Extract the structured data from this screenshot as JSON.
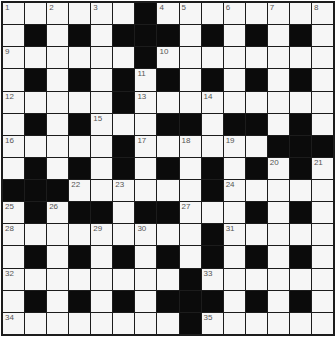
{
  "puzzle": {
    "rows": 15,
    "cols": 15,
    "colors": {
      "white_cell": "#f6f6f6",
      "black_cell": "#0b0b0b",
      "grid_line": "#1c1c1c",
      "number_text": "#555555"
    },
    "grid": [
      "......#........",
      ".#.#.###.#.#.#.",
      "......#........",
      ".#.#.#.#.#.#.#.",
      ".....#.........",
      ".#.#...##.##.#.",
      ".....#......###",
      ".#.#.#.#.#.#.#.",
      "###......#.....",
      ".#.##.##...#.#.",
      ".........#.....",
      ".#.#.#.#.#.#.#.",
      "........#......",
      ".#.#.#.###.#.#.",
      "........#......"
    ],
    "numbers": [
      {
        "n": "1",
        "r": 0,
        "c": 0
      },
      {
        "n": "2",
        "r": 0,
        "c": 2
      },
      {
        "n": "3",
        "r": 0,
        "c": 4
      },
      {
        "n": "4",
        "r": 0,
        "c": 7
      },
      {
        "n": "5",
        "r": 0,
        "c": 8
      },
      {
        "n": "6",
        "r": 0,
        "c": 10
      },
      {
        "n": "7",
        "r": 0,
        "c": 12
      },
      {
        "n": "8",
        "r": 0,
        "c": 14
      },
      {
        "n": "9",
        "r": 2,
        "c": 0
      },
      {
        "n": "10",
        "r": 2,
        "c": 7
      },
      {
        "n": "11",
        "r": 3,
        "c": 6
      },
      {
        "n": "12",
        "r": 4,
        "c": 0
      },
      {
        "n": "13",
        "r": 4,
        "c": 6
      },
      {
        "n": "14",
        "r": 4,
        "c": 9
      },
      {
        "n": "15",
        "r": 5,
        "c": 4
      },
      {
        "n": "16",
        "r": 6,
        "c": 0
      },
      {
        "n": "17",
        "r": 6,
        "c": 6
      },
      {
        "n": "18",
        "r": 6,
        "c": 8
      },
      {
        "n": "19",
        "r": 6,
        "c": 10
      },
      {
        "n": "20",
        "r": 7,
        "c": 12
      },
      {
        "n": "21",
        "r": 7,
        "c": 14
      },
      {
        "n": "22",
        "r": 8,
        "c": 3
      },
      {
        "n": "23",
        "r": 8,
        "c": 5
      },
      {
        "n": "24",
        "r": 8,
        "c": 10
      },
      {
        "n": "25",
        "r": 9,
        "c": 0
      },
      {
        "n": "26",
        "r": 9,
        "c": 2
      },
      {
        "n": "27",
        "r": 9,
        "c": 8
      },
      {
        "n": "28",
        "r": 10,
        "c": 0
      },
      {
        "n": "29",
        "r": 10,
        "c": 4
      },
      {
        "n": "30",
        "r": 10,
        "c": 6
      },
      {
        "n": "31",
        "r": 10,
        "c": 10
      },
      {
        "n": "32",
        "r": 12,
        "c": 0
      },
      {
        "n": "33",
        "r": 12,
        "c": 9
      },
      {
        "n": "34",
        "r": 14,
        "c": 0
      },
      {
        "n": "35",
        "r": 14,
        "c": 9
      }
    ]
  }
}
